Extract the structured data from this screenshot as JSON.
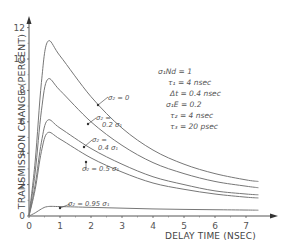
{
  "chart_data": {
    "type": "line",
    "title": "",
    "xlabel": "DELAY TIME (NSEC)",
    "ylabel": "TRANSMISSION CHANGE (PERCENT)",
    "xlim": [
      0,
      7.6
    ],
    "ylim": [
      0,
      12.5
    ],
    "xticks": [
      "0",
      "1",
      "2",
      "3",
      "4",
      "5",
      "6",
      "7"
    ],
    "yticks": [
      "0",
      "2",
      "4",
      "6",
      "8",
      "10",
      "12"
    ],
    "grid": false,
    "legend_position": "none",
    "series": [
      {
        "name": "σ2 = 0",
        "x": [
          0,
          0.2,
          0.4,
          0.6,
          1,
          2,
          3,
          4,
          5,
          6,
          7,
          7.4
        ],
        "values": [
          0,
          3.5,
          8.5,
          11.1,
          10.2,
          7.6,
          5.6,
          4.2,
          3.3,
          2.7,
          2.3,
          2.2
        ]
      },
      {
        "name": "σ2 = 0.2 σ1",
        "x": [
          0,
          0.2,
          0.4,
          0.6,
          1,
          2,
          3,
          4,
          5,
          6,
          7,
          7.4
        ],
        "values": [
          0,
          2.8,
          6.7,
          8.7,
          8.0,
          6.0,
          4.5,
          3.4,
          2.7,
          2.2,
          1.9,
          1.8
        ]
      },
      {
        "name": "σ2 = 0.4 σ1",
        "x": [
          0,
          0.2,
          0.4,
          0.6,
          1,
          2,
          3,
          4,
          5,
          6,
          7,
          7.4
        ],
        "values": [
          0,
          2.0,
          4.7,
          6.1,
          5.6,
          4.3,
          3.3,
          2.5,
          2.0,
          1.6,
          1.4,
          1.35
        ]
      },
      {
        "name": "σ2 = 0.5 σ1",
        "x": [
          0,
          0.2,
          0.4,
          0.6,
          1,
          2,
          3,
          4,
          5,
          6,
          7,
          7.4
        ],
        "values": [
          0,
          1.7,
          4.1,
          5.3,
          4.9,
          3.7,
          2.8,
          2.1,
          1.7,
          1.4,
          1.2,
          1.15
        ]
      },
      {
        "name": "σ2 = 0.95 σ1",
        "x": [
          0,
          0.2,
          0.4,
          0.6,
          1,
          2,
          3,
          4,
          5,
          6,
          7,
          7.4
        ],
        "values": [
          0,
          0.2,
          0.45,
          0.6,
          0.6,
          0.55,
          0.5,
          0.45,
          0.42,
          0.4,
          0.38,
          0.37
        ]
      }
    ],
    "annotations": [
      "σ1Nd = 1",
      "τ1 = 4 nsec",
      "Δt = 0.4 nsec",
      "σ1E = 0.2",
      "τ2 = 4 nsec",
      "τ3 = 20 psec"
    ]
  },
  "labels": {
    "ylabel": "TRANSMISSION CHANGE (PERCENT)",
    "xlabel": "DELAY TIME (NSEC)",
    "curve_labels": [
      "σ₂ = 0",
      "σ₂ =",
      "0.2 σ₁",
      "σ₂ =",
      "0.4 σ₁",
      "σ₂ = 0.5 σ₁",
      "σ₂ = 0.95 σ₁"
    ],
    "params": [
      "σ₁Nd = 1",
      "τ₁ = 4 nsec",
      "Δt = 0.4 nsec",
      "σ₁E = 0.2",
      "τ₂ = 4 nsec",
      "τ₃ = 20 psec"
    ]
  }
}
